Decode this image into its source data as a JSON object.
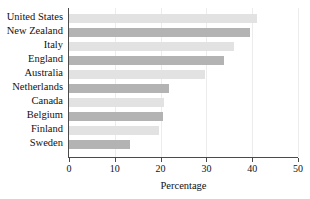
{
  "chart_data": {
    "type": "bar",
    "orientation": "horizontal",
    "title": "",
    "xlabel": "Percentage",
    "ylabel": "",
    "xlim": [
      0,
      50
    ],
    "xticks": [
      0,
      10,
      20,
      30,
      40,
      50
    ],
    "grid": true,
    "legend": "none",
    "categories": [
      "United States",
      "New Zealand",
      "Italy",
      "England",
      "Australia",
      "Netherlands",
      "Canada",
      "Belgium",
      "Finland",
      "Sweden"
    ],
    "values": [
      41.1,
      39.5,
      36.0,
      33.8,
      29.8,
      21.9,
      20.8,
      20.5,
      19.6,
      13.4
    ],
    "bar_colors": [
      "#e2e2e2",
      "#b3b3b3",
      "#e2e2e2",
      "#b3b3b3",
      "#e2e2e2",
      "#b3b3b3",
      "#e2e2e2",
      "#b3b3b3",
      "#e2e2e2",
      "#b3b3b3"
    ]
  },
  "axis": {
    "tick_labels": [
      "0",
      "10",
      "20",
      "30",
      "40",
      "50"
    ],
    "title": "Percentage"
  },
  "colors": {
    "bar_light": "#e2e2e2",
    "bar_dark": "#b3b3b3",
    "axis": "#4a4a4a",
    "grid": "#ececed",
    "text": "#111111",
    "background": "#ffffff"
  }
}
